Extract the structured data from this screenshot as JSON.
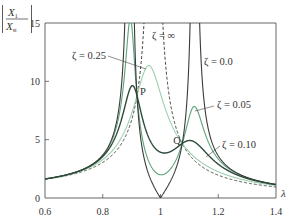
{
  "chart_data": {
    "type": "line",
    "title": "",
    "xlabel": "λ",
    "ylabel": "|X1 / Xst|",
    "ylabel_num": "X",
    "ylabel_num_sub": "1",
    "ylabel_den": "X",
    "ylabel_den_sub": "st",
    "xlim": [
      0.6,
      1.4
    ],
    "ylim": [
      0,
      15
    ],
    "grid": false,
    "legend": "inline labels",
    "x_ticks": [
      0.6,
      0.8,
      1.0,
      1.2,
      1.4
    ],
    "x_tick_labels": [
      "0.6",
      "0.8",
      "1",
      "1.2",
      "1.4"
    ],
    "y_ticks": [
      0,
      5,
      10,
      15
    ],
    "y_tick_labels": [
      "0",
      "5",
      "10",
      "15"
    ],
    "model": {
      "description": "Dynamic vibration absorber response",
      "mass_ratio_mu": 0.05,
      "tuning_ratio_f": 1.0
    },
    "series": [
      {
        "name": "ζ=0.0",
        "zeta": 0.0,
        "color": "#3a3a3a",
        "dash": "",
        "width": 1.1,
        "points": [
          [
            0.6,
            1.64
          ],
          [
            0.8,
            4.2
          ],
          [
            0.87,
            11.5
          ],
          [
            0.894,
            "inf"
          ],
          [
            0.95,
            1.6
          ],
          [
            1.0,
            0
          ],
          [
            1.05,
            1.5
          ],
          [
            1.1,
            9.5
          ],
          [
            1.118,
            "inf"
          ],
          [
            1.2,
            2.4
          ],
          [
            1.4,
            0.75
          ]
        ]
      },
      {
        "name": "ζ=0.05",
        "zeta": 0.05,
        "color": "#5aa27a",
        "dash": "",
        "width": 1.1,
        "points": [
          [
            0.6,
            1.62
          ],
          [
            0.8,
            4.1
          ],
          [
            0.895,
            15.5
          ],
          [
            0.95,
            3.6
          ],
          [
            1.0,
            1.9
          ],
          [
            1.05,
            3.5
          ],
          [
            1.12,
            7.8
          ],
          [
            1.2,
            3.0
          ],
          [
            1.4,
            0.78
          ]
        ]
      },
      {
        "name": "ζ=0.10",
        "zeta": 0.1,
        "color": "#2e4a3a",
        "dash": "",
        "width": 1.4,
        "points": [
          [
            0.6,
            1.6
          ],
          [
            0.8,
            3.9
          ],
          [
            0.9,
            9.5
          ],
          [
            0.95,
            6.5
          ],
          [
            1.0,
            3.4
          ],
          [
            1.07,
            4.7
          ],
          [
            1.11,
            4.9
          ],
          [
            1.2,
            2.9
          ],
          [
            1.4,
            0.8
          ]
        ]
      },
      {
        "name": "ζ=0.25",
        "zeta": 0.25,
        "color": "#9ccfae",
        "dash": "",
        "width": 1.1,
        "points": [
          [
            0.6,
            1.55
          ],
          [
            0.8,
            3.4
          ],
          [
            0.919,
            8.8
          ],
          [
            0.957,
            11.3
          ],
          [
            1.0,
            8.5
          ],
          [
            1.075,
            4.67
          ],
          [
            1.2,
            1.9
          ],
          [
            1.4,
            0.75
          ]
        ]
      },
      {
        "name": "ζ=∞",
        "zeta": "inf",
        "color": "#3a3a3a",
        "dash": "3,2",
        "width": 1.0,
        "points": [
          [
            0.6,
            1.65
          ],
          [
            0.8,
            3.05
          ],
          [
            0.919,
            8.8
          ],
          [
            0.976,
            "inf"
          ],
          [
            1.075,
            4.67
          ],
          [
            1.2,
            1.95
          ],
          [
            1.4,
            0.7
          ]
        ]
      }
    ],
    "annotations": [
      {
        "text": "P",
        "x": 0.919,
        "y": 8.8,
        "note": "fixed point"
      },
      {
        "text": "Q",
        "x": 1.075,
        "y": 4.67,
        "note": "fixed point"
      }
    ],
    "inline_labels": [
      {
        "text": "ζ = 0.25",
        "px": 72,
        "py": 59,
        "leader": [
          108,
          56,
          146,
          69
        ]
      },
      {
        "text": "ζ = ∞",
        "px": 152,
        "py": 39,
        "leader": null
      },
      {
        "text": "ζ = 0.0",
        "px": 204,
        "py": 65,
        "leader": null
      },
      {
        "text": "ζ = 0.05",
        "px": 217,
        "py": 108,
        "leader": [
          214,
          106,
          195,
          111
        ]
      },
      {
        "text": "ζ = 0.10",
        "px": 222,
        "py": 148,
        "leader": [
          220,
          146,
          206,
          157
        ]
      }
    ]
  }
}
